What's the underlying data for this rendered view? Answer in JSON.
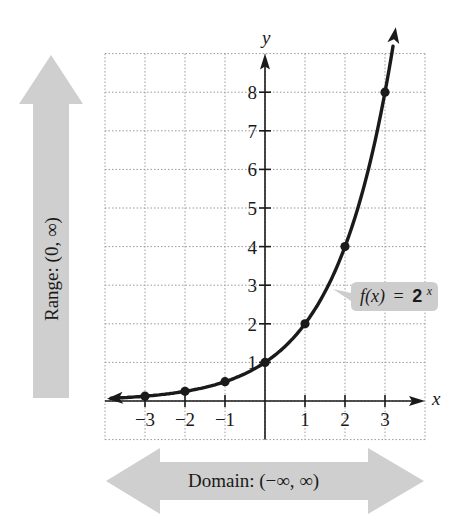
{
  "chart_data": {
    "type": "line",
    "title": "",
    "function_label": "f(x) = 2^x",
    "function_label_parts": {
      "fx": "f(x)",
      "eq": "=",
      "base": "2",
      "exp": "x"
    },
    "xlabel": "x",
    "ylabel": "y",
    "xlim": [
      -4,
      4
    ],
    "ylim": [
      -1,
      9
    ],
    "grid": true,
    "x_ticks": [
      -3,
      -2,
      -1,
      1,
      2,
      3
    ],
    "x_tick_labels": [
      "−3",
      "−2",
      "−1",
      "1",
      "2",
      "3"
    ],
    "y_ticks": [
      1,
      2,
      3,
      4,
      5,
      6,
      7,
      8
    ],
    "y_tick_labels": [
      "1",
      "2",
      "3",
      "4",
      "5",
      "6",
      "7",
      "8"
    ],
    "points": [
      {
        "x": -3,
        "y": 0.125
      },
      {
        "x": -2,
        "y": 0.25
      },
      {
        "x": -1,
        "y": 0.5
      },
      {
        "x": 0,
        "y": 1
      },
      {
        "x": 1,
        "y": 2
      },
      {
        "x": 2,
        "y": 4
      },
      {
        "x": 3,
        "y": 8
      }
    ],
    "annotations": [
      {
        "text": "Range: (0, ∞)",
        "type": "vertical-arrow",
        "position": "left"
      },
      {
        "text": "Domain: (−∞, ∞)",
        "type": "double-horizontal-arrow",
        "position": "bottom"
      }
    ]
  },
  "labels": {
    "y_axis": "y",
    "x_axis": "x",
    "range": "Range: (0, ∞)",
    "domain": "Domain: (−∞, ∞)",
    "callout_fx": "f(x)",
    "callout_eq": "=",
    "callout_base": "2",
    "callout_exp": "x"
  },
  "colors": {
    "curve": "#1a1a1a",
    "arrow_fill": "#cfcfcf",
    "callout_fill": "#cdcdcd",
    "grid": "#9a9a9a"
  }
}
